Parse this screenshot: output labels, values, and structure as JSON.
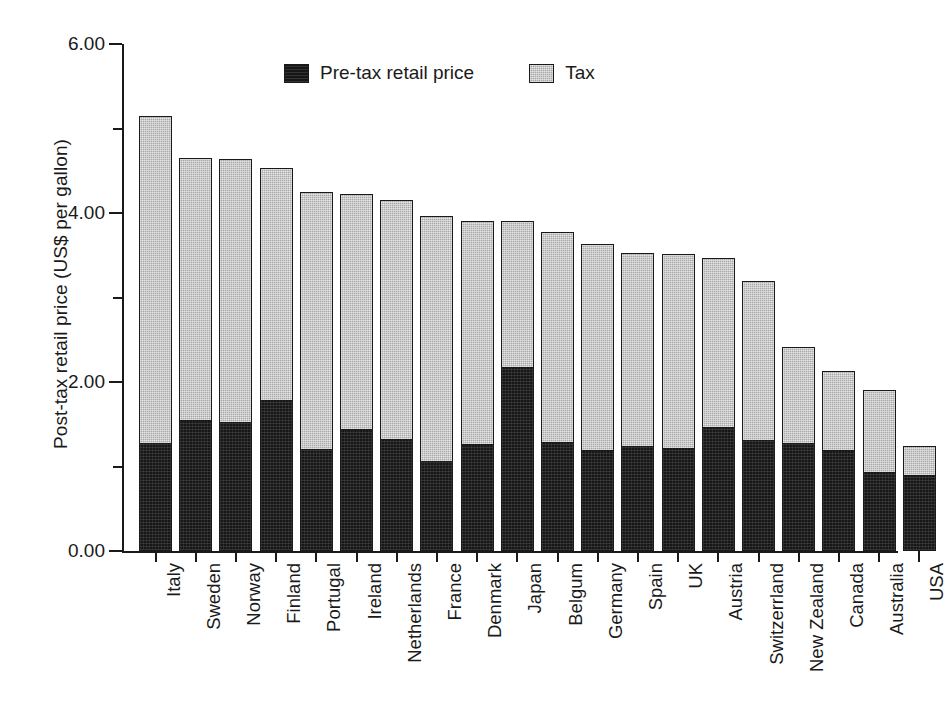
{
  "chart_data": {
    "type": "bar",
    "subtype": "stacked-vertical",
    "title": "",
    "xlabel": "",
    "ylabel": "Post-tax retail price (US$ per gallon)",
    "ylim": [
      0.0,
      6.0
    ],
    "ytick_labels": [
      "0.00",
      "2.00",
      "4.00",
      "6.00"
    ],
    "ytick_values": [
      0.0,
      2.0,
      4.0,
      6.0
    ],
    "yminor_ticks": [
      1.0,
      3.0,
      5.0
    ],
    "grid": false,
    "legend_position": "top-center",
    "categories": [
      "Italy",
      "Sweden",
      "Norway",
      "Finland",
      "Portugal",
      "Ireland",
      "Netherlands",
      "France",
      "Denmark",
      "Japan",
      "Belgum",
      "Germany",
      "Spain",
      "UK",
      "Austria",
      "Switzerrland",
      "New Zealand",
      "Canada",
      "Australia",
      "USA"
    ],
    "series": [
      {
        "name": "Pre-tax retail price",
        "color": "#171717",
        "values": [
          1.27,
          1.54,
          1.51,
          1.78,
          1.2,
          1.43,
          1.31,
          1.05,
          1.26,
          2.16,
          1.28,
          1.18,
          1.23,
          1.21,
          1.45,
          1.3,
          1.27,
          1.18,
          0.92,
          0.89
        ]
      },
      {
        "name": "Tax",
        "color": "#a8a8a8",
        "values": [
          3.88,
          3.11,
          3.13,
          2.75,
          3.05,
          2.79,
          2.85,
          2.91,
          2.64,
          1.74,
          2.49,
          2.45,
          2.3,
          2.3,
          2.02,
          1.89,
          1.14,
          0.95,
          0.98,
          0.35
        ]
      }
    ],
    "totals": [
      5.15,
      4.65,
      4.64,
      4.53,
      4.25,
      4.22,
      4.16,
      3.96,
      3.9,
      3.9,
      3.77,
      3.63,
      3.53,
      3.51,
      3.47,
      3.19,
      2.41,
      2.13,
      1.9,
      1.24
    ]
  },
  "legend": {
    "entries": [
      {
        "label": "Pre-tax retail price",
        "swatch": "black-swatch"
      },
      {
        "label": "Tax",
        "swatch": "gray-swatch"
      }
    ]
  }
}
